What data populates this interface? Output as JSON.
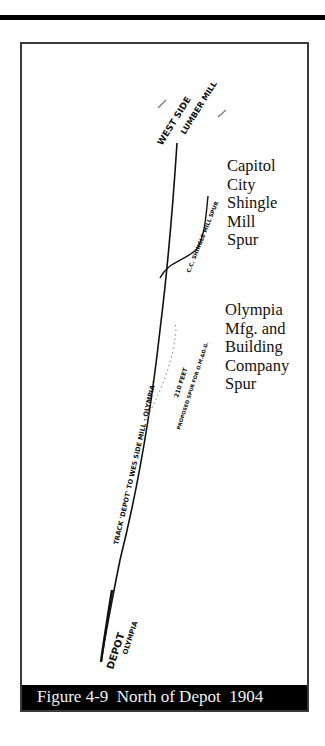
{
  "figure": {
    "caption": "Figure 4-9  North of Depot  1904"
  },
  "labels": {
    "capitol_city_spur": [
      "Capitol",
      "City",
      "Shingle",
      "Mill",
      "Spur"
    ],
    "olympia_mfg_spur": [
      "Olympia",
      "Mfg. and",
      "Building",
      "Company",
      "Spur"
    ]
  },
  "handwritten": {
    "west_side": "WEST SIDE",
    "lumber_mill": "LUMBER MILL",
    "cc_shingle_spur": "C.C. SHINGLE MILL SPUR",
    "track": "TRACK 'DEPOT' TO WES SIDE MILL · OLYMPIA ·",
    "distance": "210 FEET",
    "proposed": "PROPOSED SPUR FOR O.M.&D.G.",
    "depot": "DEPOT",
    "olympia": "OLYMPIA"
  },
  "colors": {
    "ink": "#111111",
    "caption_bg": "#000000",
    "caption_text": "#f2f2f2",
    "frame": "#3a3a3a"
  }
}
